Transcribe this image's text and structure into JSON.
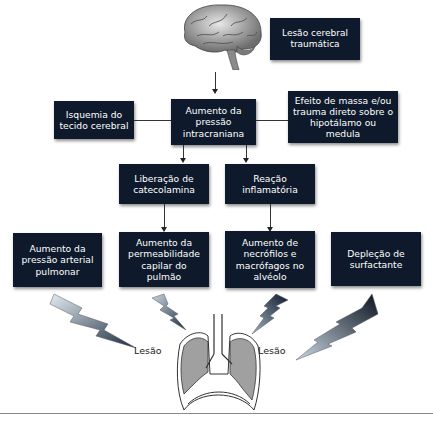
{
  "diagram": {
    "trigger": {
      "label": "Lesão cerebral\ntraumática",
      "icon": "brain-icon"
    },
    "level1": [
      {
        "id": "isquemia",
        "label": "Isquemia do\ntecido cerebral"
      },
      {
        "id": "pic",
        "label": "Aumento da\npressão\nintracraniana"
      },
      {
        "id": "efeito",
        "label": "Efeito de massa e/ou\ntrauma direto sobre o\nhipotálamo ou medula"
      }
    ],
    "level2": [
      {
        "id": "catecolamina",
        "label": "Liberação de\ncatecolamina"
      },
      {
        "id": "inflamatoria",
        "label": "Reação\ninflamatória"
      }
    ],
    "level3": [
      {
        "id": "pap",
        "label": "Aumento da\npressão arterial\npulmonar"
      },
      {
        "id": "permeabilidade",
        "label": "Aumento da\npermeabilidade\ncapilar do pulmão"
      },
      {
        "id": "neutrofilos",
        "label": "Aumento de\nnecrófilos e\nmacrófagos no\nalvéolo"
      },
      {
        "id": "surfactante",
        "label": "Depleção de\nsurfactante"
      }
    ],
    "outcome": {
      "icon": "lungs-icon",
      "left_label": "Lesão",
      "right_label": "Lesão",
      "lightning_icons": 4
    },
    "colors": {
      "box_fill": "#0e1a2b",
      "box_text": "#ffffff",
      "lung_fill": "#9e9e9e",
      "bolt_dark": "#1a2a3d",
      "bolt_light": "#c9d6e0"
    }
  }
}
